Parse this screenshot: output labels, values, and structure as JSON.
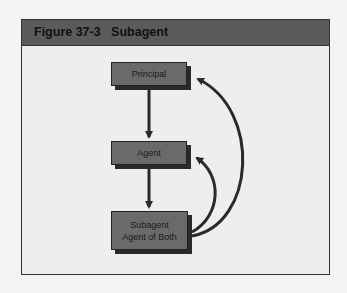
{
  "figure": {
    "label": "Figure 37-3",
    "title": "Subagent"
  },
  "nodes": [
    {
      "id": "principal",
      "lines": [
        "Principal"
      ]
    },
    {
      "id": "agent",
      "lines": [
        "Agent"
      ]
    },
    {
      "id": "subagent",
      "lines": [
        "Subagent",
        "Agent of Both"
      ]
    }
  ],
  "edges": [
    {
      "from": "principal",
      "to": "agent",
      "style": "straight"
    },
    {
      "from": "agent",
      "to": "subagent",
      "style": "straight"
    },
    {
      "from": "subagent",
      "to": "agent",
      "style": "curved"
    },
    {
      "from": "subagent",
      "to": "principal",
      "style": "curved"
    }
  ],
  "colors": {
    "header": "#5b5b5b",
    "box": "#6a6a6a",
    "arrow": "#2a2a2a",
    "background": "#eeeeec"
  }
}
